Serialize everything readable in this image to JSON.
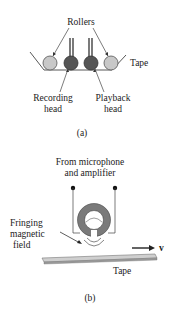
{
  "panel_a": {
    "label_rollers": "Rollers",
    "label_tape": "Tape",
    "label_recording_line1": "Recording",
    "label_recording_line2": "head",
    "label_playback_line1": "Playback",
    "label_playback_line2": "head",
    "caption": "(a)"
  },
  "panel_b": {
    "label_source_line1": "From microphone",
    "label_source_line2": "and amplifier",
    "label_field_line1": "Fringing",
    "label_field_line2": "magnetic",
    "label_field_line3": "field",
    "label_velocity": "v",
    "label_tape": "Tape",
    "caption": "(b)"
  },
  "colors": {
    "roller": "#c8c8c8",
    "head": "#555555",
    "coil": "#8a8a8a",
    "tape": "#cfcfcf"
  }
}
